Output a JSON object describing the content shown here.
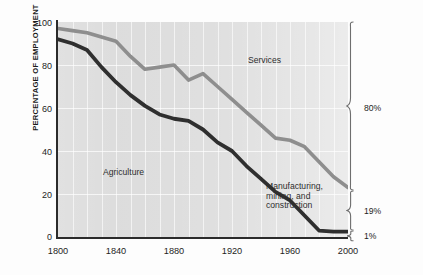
{
  "chart_data": {
    "type": "line",
    "title": "",
    "xlabel": "",
    "ylabel": "PERCENTAGE OF EMPLOYMENT",
    "xlim": [
      1800,
      2000
    ],
    "ylim": [
      0,
      100
    ],
    "grid": true,
    "legend_position": "inline-annotations",
    "x_ticks": [
      "1800",
      "1840",
      "1880",
      "1920",
      "1960",
      "2000"
    ],
    "y_ticks": [
      "0",
      "20",
      "40",
      "60",
      "80",
      "100"
    ],
    "series": [
      {
        "name": "Services",
        "description": "Upper boundary line: cumulative share above which is Services",
        "color": "#8e8e8e",
        "x": [
          1800,
          1810,
          1820,
          1830,
          1840,
          1850,
          1860,
          1870,
          1880,
          1890,
          1900,
          1910,
          1920,
          1930,
          1940,
          1950,
          1960,
          1970,
          1980,
          1990,
          2000
        ],
        "values": [
          97,
          96,
          95,
          93,
          91,
          84,
          78,
          79,
          80,
          73,
          76,
          70,
          64,
          58,
          52,
          46,
          45,
          42,
          35,
          28,
          23
        ]
      },
      {
        "name": "Agriculture",
        "description": "Lower boundary line: area below is Agriculture",
        "color": "#2f2f2f",
        "x": [
          1800,
          1810,
          1820,
          1830,
          1840,
          1850,
          1860,
          1870,
          1880,
          1890,
          1900,
          1910,
          1920,
          1930,
          1940,
          1950,
          1960,
          1970,
          1980,
          1990,
          2000
        ],
        "values": [
          92,
          90,
          87,
          79,
          72,
          66,
          61,
          57,
          55,
          54,
          50,
          44,
          40,
          33,
          27,
          21,
          17,
          10,
          3,
          2.5,
          2.5
        ]
      }
    ],
    "band_labels": [
      {
        "label": "Services",
        "x_px": 248,
        "y_px": 56
      },
      {
        "label": "Agriculture",
        "x_px": 103,
        "y_px": 168
      },
      {
        "label": "Manufacturing, mining, and construction",
        "x_px": 266,
        "y_px": 182
      }
    ],
    "right_annotations": [
      {
        "label": "80%",
        "span_top_pct": 100,
        "span_bottom_pct": 22
      },
      {
        "label": "19%",
        "span_top_pct": 22,
        "span_bottom_pct": 2.5
      },
      {
        "label": "1%",
        "span_top_pct": 2.5,
        "span_bottom_pct": 0
      }
    ],
    "colors": {
      "plot_background": "#dcdcdc",
      "services_line": "#8e8e8e",
      "agriculture_line": "#2f2f2f",
      "axis": "#2b2b2b",
      "gridline": "#ffffff",
      "text": "#1d1d1d",
      "page_background": "#fdfdfd"
    }
  },
  "axis": {
    "y_title": "PERCENTAGE OF EMPLOYMENT"
  },
  "labels": {
    "services": "Services",
    "agriculture": "Agriculture",
    "manufacturing_line1": "Manufacturing,",
    "manufacturing_line2": "mining, and",
    "manufacturing_line3": "construction",
    "pct_80": "80%",
    "pct_19": "19%",
    "pct_1": "1%"
  }
}
